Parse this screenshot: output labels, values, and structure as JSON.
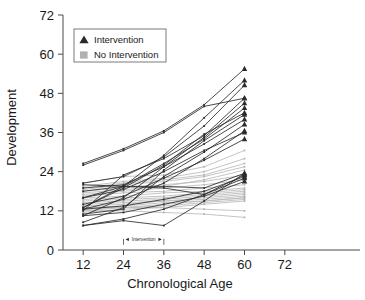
{
  "chart_data": {
    "type": "line",
    "title": "",
    "xlabel": "Chronological Age",
    "ylabel": "Development",
    "xlim": [
      6,
      78
    ],
    "ylim": [
      0,
      72
    ],
    "xticks": [
      12,
      24,
      36,
      48,
      60,
      72
    ],
    "yticks": [
      0,
      12,
      24,
      36,
      48,
      60,
      72
    ],
    "xtick_labels": [
      "12",
      "24",
      "36",
      "48",
      "60",
      "72"
    ],
    "ytick_labels": [
      "0",
      "12",
      "24",
      "36",
      "48",
      "60",
      "72"
    ],
    "grid": false,
    "legend_position": "upper-left",
    "legend_entries": [
      {
        "label": "Intervention",
        "marker": "triangle",
        "color": "#2b2b2b"
      },
      {
        "label": "No Intervention",
        "marker": "square",
        "color": "#b0b0b0"
      }
    ],
    "annotations": [
      {
        "text": "Intervention",
        "x_start": 24,
        "x_end": 36,
        "y": 2.2,
        "style": "double-arrow-span"
      }
    ],
    "x": [
      12,
      24,
      36,
      48,
      60
    ],
    "series": [
      {
        "name": "Intervention",
        "group": "intervention",
        "color": "#2b2b2b",
        "marker": "triangle",
        "subjects": [
          {
            "id": "i01",
            "values": [
              26.5,
              31.0,
              36.5,
              44.5,
              55.5
            ]
          },
          {
            "id": "i02",
            "values": [
              13.0,
              19.5,
              29.0,
              40.5,
              52.0
            ]
          },
          {
            "id": "i03",
            "values": [
              20.5,
              22.5,
              28.5,
              38.0,
              50.5
            ]
          },
          {
            "id": "i04",
            "values": [
              26.0,
              30.5,
              36.0,
              44.0,
              46.5
            ]
          },
          {
            "id": "i05",
            "values": [
              12.0,
              23.0,
              28.0,
              35.0,
              46.5
            ]
          },
          {
            "id": "i06",
            "values": [
              10.5,
              16.0,
              25.5,
              34.5,
              45.0
            ]
          },
          {
            "id": "i07",
            "values": [
              20.0,
              19.5,
              26.5,
              34.0,
              43.5
            ]
          },
          {
            "id": "i08",
            "values": [
              13.0,
              19.0,
              26.0,
              35.5,
              42.0
            ]
          },
          {
            "id": "i09",
            "values": [
              11.0,
              12.5,
              24.5,
              33.5,
              41.5
            ]
          },
          {
            "id": "i10",
            "values": [
              19.0,
              20.0,
              25.5,
              32.5,
              40.0
            ]
          },
          {
            "id": "i11",
            "values": [
              8.5,
              13.0,
              22.5,
              30.0,
              38.5
            ]
          },
          {
            "id": "i12",
            "values": [
              12.5,
              15.5,
              20.5,
              28.0,
              36.5
            ]
          },
          {
            "id": "i13",
            "values": [
              16.0,
              18.5,
              24.0,
              30.5,
              36.0
            ]
          },
          {
            "id": "i14",
            "values": [
              14.0,
              16.5,
              22.0,
              27.5,
              34.0
            ]
          },
          {
            "id": "i15",
            "values": [
              7.5,
              9.0,
              7.5,
              15.0,
              23.5
            ]
          },
          {
            "id": "i16",
            "values": [
              7.5,
              9.5,
              12.5,
              17.0,
              23.0
            ]
          },
          {
            "id": "i17",
            "values": [
              12.5,
              13.5,
              15.5,
              18.0,
              22.5
            ]
          },
          {
            "id": "i18",
            "values": [
              10.5,
              11.5,
              14.0,
              16.5,
              21.0
            ]
          },
          {
            "id": "i19",
            "values": [
              18.0,
              19.5,
              19.5,
              19.0,
              23.5
            ]
          },
          {
            "id": "i20",
            "values": [
              16.0,
              19.5,
              19.0,
              17.0,
              22.0
            ]
          }
        ]
      },
      {
        "name": "No Intervention",
        "group": "control",
        "color": "#b0b0b0",
        "marker": "square",
        "subjects": [
          {
            "id": "c01",
            "values": [
              20.5,
              22.5,
              23.0,
              25.5,
              30.5
            ]
          },
          {
            "id": "c02",
            "values": [
              19.5,
              21.0,
              22.0,
              24.0,
              28.0
            ]
          },
          {
            "id": "c03",
            "values": [
              18.5,
              20.0,
              21.0,
              22.5,
              25.5
            ]
          },
          {
            "id": "c04",
            "values": [
              18.0,
              19.0,
              20.0,
              21.0,
              23.0
            ]
          },
          {
            "id": "c05",
            "values": [
              17.0,
              18.0,
              19.0,
              20.0,
              21.5
            ]
          },
          {
            "id": "c06",
            "values": [
              16.5,
              17.5,
              18.0,
              19.0,
              20.0
            ]
          },
          {
            "id": "c07",
            "values": [
              16.0,
              16.5,
              17.5,
              18.0,
              19.0
            ]
          },
          {
            "id": "c08",
            "values": [
              15.5,
              16.0,
              16.5,
              17.5,
              18.5
            ]
          },
          {
            "id": "c09",
            "values": [
              15.0,
              15.5,
              16.0,
              17.0,
              18.0
            ]
          },
          {
            "id": "c10",
            "values": [
              14.5,
              15.0,
              15.5,
              16.5,
              17.5
            ]
          },
          {
            "id": "c11",
            "values": [
              14.0,
              14.5,
              15.0,
              16.0,
              17.0
            ]
          },
          {
            "id": "c12",
            "values": [
              13.5,
              14.0,
              15.0,
              15.5,
              16.5
            ]
          },
          {
            "id": "c13",
            "values": [
              13.0,
              13.5,
              14.5,
              15.0,
              16.0
            ]
          },
          {
            "id": "c14",
            "values": [
              12.5,
              13.0,
              14.0,
              15.0,
              16.0
            ]
          },
          {
            "id": "c15",
            "values": [
              12.0,
              13.0,
              13.5,
              14.5,
              15.5
            ]
          },
          {
            "id": "c16",
            "values": [
              11.5,
              12.5,
              13.0,
              14.0,
              15.0
            ]
          },
          {
            "id": "c17",
            "values": [
              17.5,
              18.5,
              19.5,
              21.5,
              24.5
            ]
          },
          {
            "id": "c18",
            "values": [
              19.0,
              20.5,
              21.5,
              23.0,
              26.5
            ]
          },
          {
            "id": "c19",
            "values": [
              13.0,
              13.0,
              13.0,
              12.5,
              12.0
            ]
          },
          {
            "id": "c20",
            "values": [
              12.0,
              12.0,
              11.5,
              11.0,
              10.0
            ]
          }
        ]
      }
    ]
  }
}
